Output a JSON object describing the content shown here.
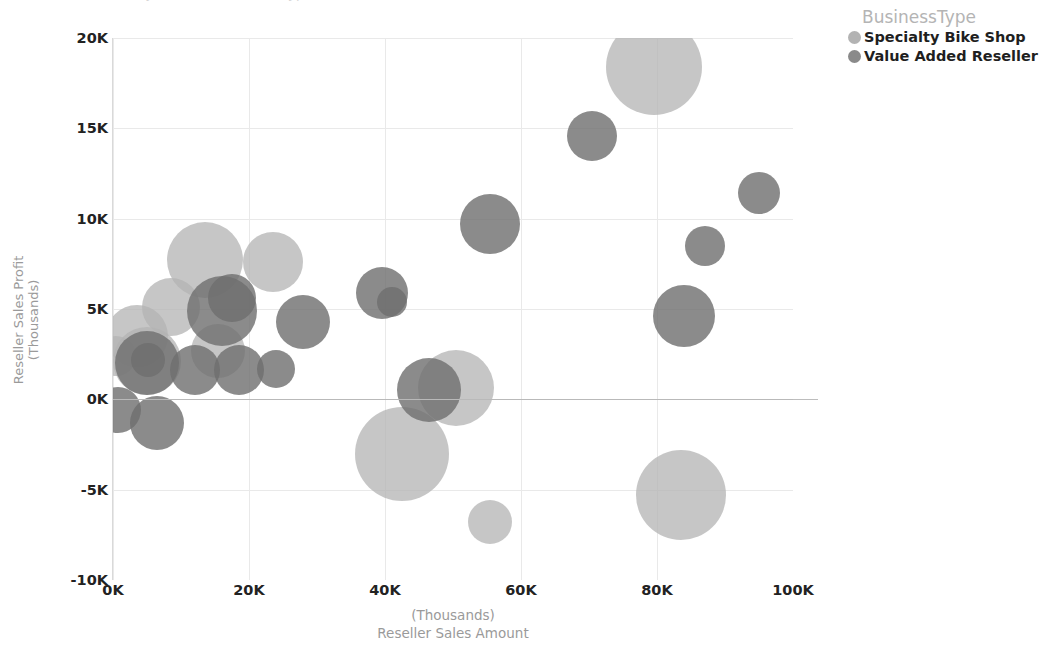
{
  "top_strip": {
    "clipped_text": "Reseller Sales Profit by Amount, Business Type and Reseller (Thousands), Fiscal Year"
  },
  "legend": {
    "title": "BusinessType",
    "items": [
      {
        "label": "Specialty Bike Shop",
        "color": "#b3b3b3"
      },
      {
        "label": "Value Added Reseller",
        "color": "#8a8a8a"
      }
    ]
  },
  "axes": {
    "y_title_line1": "Reseller Sales Profit",
    "y_title_line2": "(Thousands)",
    "x_title_line1": "(Thousands)",
    "x_title_line2": "Reseller Sales Amount",
    "y_ticks": [
      "20K",
      "15K",
      "10K",
      "5K",
      "0K",
      "-5K",
      "-10K"
    ],
    "x_ticks": [
      "0K",
      "20K",
      "40K",
      "60K",
      "80K",
      "100K"
    ]
  },
  "chart_data": {
    "type": "scatter",
    "xlabel": "Reseller Sales Amount (Thousands)",
    "ylabel": "Reseller Sales Profit (Thousands)",
    "xlim": [
      0,
      100
    ],
    "ylim": [
      -10,
      20
    ],
    "x_ticks": [
      0,
      20,
      40,
      60,
      80,
      100
    ],
    "y_ticks": [
      -10,
      -5,
      0,
      5,
      10,
      15,
      20
    ],
    "grid": true,
    "legend_position": "top-right",
    "size_encoding": "bubble area proportional to order quantity",
    "series": [
      {
        "name": "Specialty Bike Shop",
        "color": "#b3b3b3",
        "opacity": 0.75,
        "points": [
          {
            "x": 0.5,
            "y": 2.4,
            "r": 20
          },
          {
            "x": 3.5,
            "y": 3.5,
            "r": 31
          },
          {
            "x": 5.0,
            "y": 2.1,
            "r": 34
          },
          {
            "x": 8.5,
            "y": 5.1,
            "r": 29
          },
          {
            "x": 13.5,
            "y": 7.7,
            "r": 38
          },
          {
            "x": 23.5,
            "y": 7.6,
            "r": 30
          },
          {
            "x": 15.5,
            "y": 2.7,
            "r": 27
          },
          {
            "x": 42.5,
            "y": -3.0,
            "r": 47
          },
          {
            "x": 50.5,
            "y": 0.6,
            "r": 38
          },
          {
            "x": 55.5,
            "y": -6.8,
            "r": 22
          },
          {
            "x": 79.5,
            "y": 18.4,
            "r": 48
          },
          {
            "x": 83.5,
            "y": -5.3,
            "r": 45
          }
        ]
      },
      {
        "name": "Value Added Reseller",
        "color": "#6e6e6e",
        "opacity": 0.8,
        "points": [
          {
            "x": 0.8,
            "y": -0.6,
            "r": 23
          },
          {
            "x": 5.0,
            "y": 2.0,
            "r": 32
          },
          {
            "x": 5.2,
            "y": 2.2,
            "r": 17
          },
          {
            "x": 6.5,
            "y": -1.3,
            "r": 27
          },
          {
            "x": 12.0,
            "y": 1.6,
            "r": 25
          },
          {
            "x": 16.0,
            "y": 4.9,
            "r": 35
          },
          {
            "x": 17.5,
            "y": 5.6,
            "r": 24
          },
          {
            "x": 18.5,
            "y": 1.6,
            "r": 25
          },
          {
            "x": 24.0,
            "y": 1.7,
            "r": 19
          },
          {
            "x": 28.0,
            "y": 4.3,
            "r": 27
          },
          {
            "x": 39.5,
            "y": 5.9,
            "r": 26
          },
          {
            "x": 41.0,
            "y": 5.4,
            "r": 15
          },
          {
            "x": 46.5,
            "y": 0.5,
            "r": 32
          },
          {
            "x": 55.5,
            "y": 9.7,
            "r": 30
          },
          {
            "x": 70.5,
            "y": 14.6,
            "r": 25
          },
          {
            "x": 84.0,
            "y": 4.6,
            "r": 31
          },
          {
            "x": 87.0,
            "y": 8.5,
            "r": 20
          },
          {
            "x": 95.0,
            "y": 11.4,
            "r": 21
          }
        ]
      }
    ]
  }
}
